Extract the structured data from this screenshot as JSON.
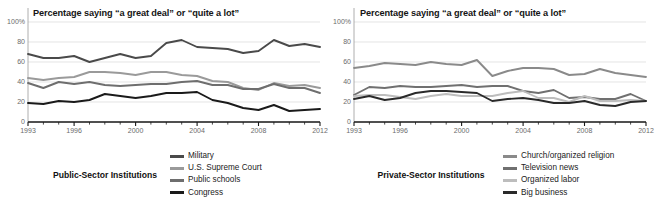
{
  "figure": {
    "panels": [
      {
        "key": "public",
        "caption": "Public-Sector Institutions",
        "title": "Percentage saying “a great deal” or “quite a lot”"
      },
      {
        "key": "private",
        "caption": "Private-Sector Institutions",
        "title": "Percentage saying “a great deal” or “quite a lot”"
      }
    ]
  },
  "chart_data": [
    {
      "type": "line",
      "title": "Percentage saying “a great deal” or “quite a lot”",
      "caption": "Public-Sector Institutions",
      "xlabel": "",
      "ylabel": "",
      "ylim": [
        0,
        100
      ],
      "yticks": [
        0,
        20,
        40,
        60,
        80,
        100
      ],
      "ytick_labels": [
        "0",
        "20",
        "40",
        "60",
        "80",
        "100%"
      ],
      "xlim": [
        1993,
        2012
      ],
      "xticks": [
        1993,
        1996,
        2000,
        2004,
        2008,
        2012
      ],
      "xtick_labels": [
        "1993",
        "1996",
        "2000",
        "2004",
        "2008",
        "2012"
      ],
      "grid": "horizontal",
      "legend_position": "bottom-right",
      "x": [
        1993,
        1994,
        1995,
        1996,
        1997,
        1998,
        1999,
        2000,
        2001,
        2002,
        2003,
        2004,
        2005,
        2006,
        2007,
        2008,
        2009,
        2010,
        2011,
        2012
      ],
      "series": [
        {
          "name": "Military",
          "color": "#4a4a4a",
          "values": [
            68,
            64,
            64,
            66,
            60,
            64,
            68,
            64,
            66,
            79,
            82,
            75,
            74,
            73,
            69,
            71,
            82,
            76,
            78,
            75
          ]
        },
        {
          "name": "U.S. Supreme Court",
          "color": "#9a9a9a",
          "values": [
            44,
            42,
            44,
            45,
            50,
            50,
            49,
            47,
            50,
            50,
            47,
            46,
            41,
            40,
            34,
            32,
            39,
            36,
            37,
            34
          ]
        },
        {
          "name": "Public schools",
          "color": "#6e6e6e",
          "values": [
            39,
            34,
            40,
            38,
            40,
            37,
            36,
            37,
            38,
            38,
            40,
            41,
            37,
            37,
            33,
            33,
            38,
            34,
            34,
            29
          ]
        },
        {
          "name": "Congress",
          "color": "#1a1a1a",
          "values": [
            19,
            18,
            21,
            20,
            22,
            28,
            26,
            24,
            26,
            29,
            29,
            30,
            22,
            19,
            14,
            12,
            17,
            11,
            12,
            13
          ]
        }
      ]
    },
    {
      "type": "line",
      "title": "Percentage saying “a great deal” or “quite a lot”",
      "caption": "Private-Sector Institutions",
      "xlabel": "",
      "ylabel": "",
      "ylim": [
        0,
        100
      ],
      "yticks": [
        0,
        20,
        40,
        60,
        80,
        100
      ],
      "ytick_labels": [
        "0",
        "20",
        "40",
        "60",
        "80",
        "100%"
      ],
      "xlim": [
        1993,
        2012
      ],
      "xticks": [
        1993,
        1996,
        2000,
        2004,
        2008,
        2012
      ],
      "xtick_labels": [
        "1993",
        "1996",
        "2000",
        "2004",
        "2008",
        "2012"
      ],
      "grid": "horizontal",
      "legend_position": "bottom-right",
      "x": [
        1993,
        1994,
        1995,
        1996,
        1997,
        1998,
        1999,
        2000,
        2001,
        2002,
        2003,
        2004,
        2005,
        2006,
        2007,
        2008,
        2009,
        2010,
        2011,
        2012
      ],
      "series": [
        {
          "name": "Church/organized religion",
          "color": "#8a8a8a",
          "values": [
            54,
            56,
            59,
            58,
            57,
            60,
            58,
            57,
            62,
            46,
            51,
            54,
            54,
            53,
            47,
            48,
            53,
            49,
            47,
            45
          ]
        },
        {
          "name": "Television news",
          "color": "#707070",
          "values": [
            27,
            35,
            34,
            36,
            35,
            35,
            36,
            37,
            35,
            36,
            36,
            31,
            29,
            32,
            24,
            25,
            23,
            23,
            28,
            21
          ]
        },
        {
          "name": "Organized labor",
          "color": "#bdbdbd",
          "values": [
            26,
            27,
            27,
            25,
            23,
            26,
            28,
            26,
            26,
            26,
            29,
            31,
            24,
            24,
            20,
            26,
            21,
            21,
            22,
            21
          ]
        },
        {
          "name": "Big business",
          "color": "#2a2a2a",
          "values": [
            23,
            26,
            22,
            24,
            29,
            31,
            31,
            30,
            29,
            21,
            23,
            24,
            22,
            19,
            19,
            21,
            17,
            16,
            20,
            21
          ]
        }
      ]
    }
  ]
}
